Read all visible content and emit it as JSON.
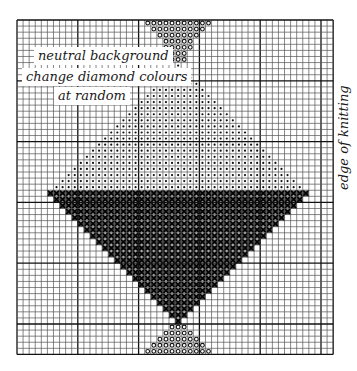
{
  "labels": {
    "line1": "neutral background",
    "line2": "change diamond colours",
    "line3": "at random",
    "side": "edge of knitting"
  },
  "grid": {
    "origin_x": 17,
    "origin_y": 20,
    "cell": 6.08,
    "cols": 52,
    "rows": 55,
    "major_every": 10,
    "line_color": "#555555",
    "major_color": "#111111"
  },
  "motif": {
    "center_col": 26,
    "mid_row": 28,
    "half_width": 21,
    "upper_symbol": "dot",
    "lower_symbol": "cross",
    "stem_symbol": "circle",
    "top_stem_rows": [
      {
        "row": 0,
        "from": 21,
        "to": 31
      },
      {
        "row": 1,
        "from": 22,
        "to": 30
      },
      {
        "row": 2,
        "from": 23,
        "to": 29
      },
      {
        "row": 3,
        "from": 24,
        "to": 28
      },
      {
        "row": 4,
        "from": 24,
        "to": 28
      },
      {
        "row": 5,
        "from": 25,
        "to": 27
      },
      {
        "row": 6,
        "from": 25,
        "to": 27
      }
    ],
    "bottom_stem_rows": [
      {
        "row": 50,
        "from": 25,
        "to": 27
      },
      {
        "row": 51,
        "from": 24,
        "to": 28
      },
      {
        "row": 52,
        "from": 23,
        "to": 29
      },
      {
        "row": 53,
        "from": 22,
        "to": 30
      },
      {
        "row": 54,
        "from": 21,
        "to": 31
      }
    ],
    "ink_color": "#111111"
  }
}
